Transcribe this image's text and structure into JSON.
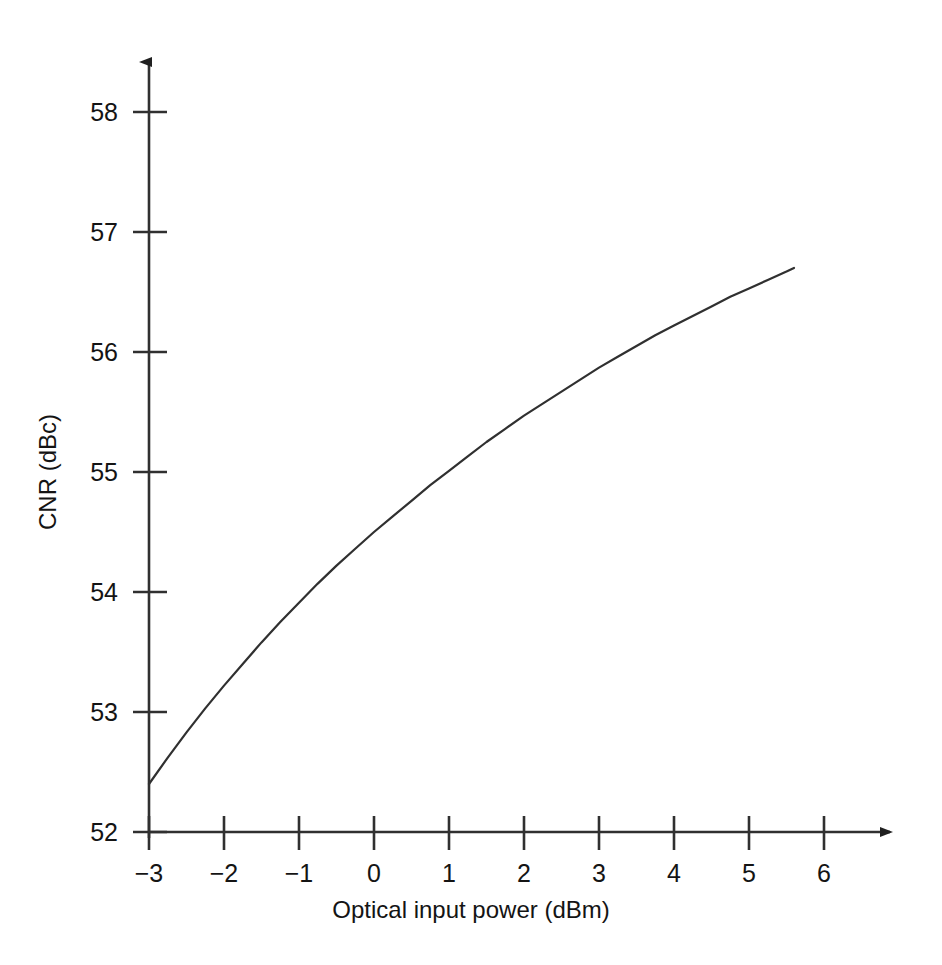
{
  "chart_data": {
    "type": "line",
    "title": "",
    "xlabel": "Optical input power (dBm)",
    "ylabel": "CNR (dBc)",
    "xlim": [
      -3,
      6
    ],
    "ylim": [
      52,
      58
    ],
    "grid": false,
    "legend": null,
    "x_ticks": [
      "−3",
      "−2",
      "−1",
      "0",
      "1",
      "2",
      "3",
      "4",
      "5",
      "6"
    ],
    "x_tick_values": [
      -3,
      -2,
      -1,
      0,
      1,
      2,
      3,
      4,
      5,
      6
    ],
    "y_ticks": [
      "52",
      "53",
      "54",
      "55",
      "56",
      "57",
      "58"
    ],
    "y_tick_values": [
      52,
      53,
      54,
      55,
      56,
      57,
      58
    ],
    "series": [
      {
        "name": "CNR vs optical input power",
        "color": "#303030",
        "x": [
          -3.0,
          -2.75,
          -2.5,
          -2.25,
          -2.0,
          -1.75,
          -1.5,
          -1.25,
          -1.0,
          -0.75,
          -0.5,
          -0.25,
          0.0,
          0.25,
          0.5,
          0.75,
          1.0,
          1.25,
          1.5,
          1.75,
          2.0,
          2.25,
          2.5,
          2.75,
          3.0,
          3.25,
          3.5,
          3.75,
          4.0,
          4.25,
          4.5,
          4.75,
          5.0,
          5.25,
          5.5,
          5.6
        ],
        "y": [
          52.4,
          52.62,
          52.83,
          53.03,
          53.22,
          53.4,
          53.58,
          53.75,
          53.91,
          54.07,
          54.22,
          54.36,
          54.5,
          54.63,
          54.76,
          54.89,
          55.01,
          55.13,
          55.25,
          55.36,
          55.47,
          55.57,
          55.67,
          55.77,
          55.87,
          55.96,
          56.05,
          56.14,
          56.22,
          56.3,
          56.38,
          56.46,
          56.53,
          56.6,
          56.67,
          56.7
        ]
      }
    ],
    "annotations": []
  },
  "axes": {
    "x_arrow": true,
    "y_arrow": true,
    "line_color": "#303030"
  }
}
